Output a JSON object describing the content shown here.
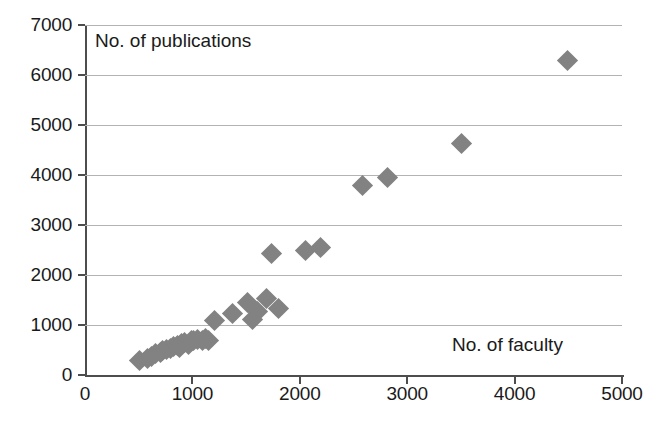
{
  "chart_data": {
    "type": "scatter",
    "title": "",
    "xlabel": "No. of faculty",
    "ylabel": "No. of publications",
    "xlim": [
      0,
      5000
    ],
    "ylim": [
      0,
      7000
    ],
    "xticks": [
      0,
      1000,
      2000,
      3000,
      4000,
      5000
    ],
    "yticks": [
      0,
      1000,
      2000,
      3000,
      4000,
      5000,
      6000,
      7000
    ],
    "xtick_labels": [
      "0",
      "1000",
      "2000",
      "3000",
      "4000",
      "5000"
    ],
    "ytick_labels": [
      "0",
      "1000",
      "2000",
      "3000",
      "4000",
      "5000",
      "6000",
      "7000"
    ],
    "grid": "horizontal",
    "marker": "diamond",
    "marker_color": "#828282",
    "axis_color": "#4d4d4d",
    "gridline_color": "#b3b3b3",
    "legend": null,
    "series": [
      {
        "name": "institutions",
        "points": [
          [
            510,
            300
          ],
          [
            580,
            330
          ],
          [
            620,
            380
          ],
          [
            660,
            430
          ],
          [
            700,
            450
          ],
          [
            720,
            500
          ],
          [
            760,
            520
          ],
          [
            800,
            540
          ],
          [
            820,
            580
          ],
          [
            860,
            600
          ],
          [
            880,
            560
          ],
          [
            900,
            640
          ],
          [
            930,
            660
          ],
          [
            960,
            620
          ],
          [
            990,
            690
          ],
          [
            1010,
            700
          ],
          [
            1050,
            720
          ],
          [
            1090,
            700
          ],
          [
            1120,
            740
          ],
          [
            1150,
            700
          ],
          [
            1210,
            1100
          ],
          [
            1370,
            1240
          ],
          [
            1510,
            1460
          ],
          [
            1560,
            1120
          ],
          [
            1610,
            1280
          ],
          [
            1690,
            1540
          ],
          [
            1740,
            2440
          ],
          [
            1800,
            1330
          ],
          [
            2050,
            2500
          ],
          [
            2190,
            2560
          ],
          [
            2580,
            3800
          ],
          [
            2820,
            3960
          ],
          [
            3510,
            4640
          ],
          [
            4490,
            6300
          ]
        ]
      }
    ]
  }
}
